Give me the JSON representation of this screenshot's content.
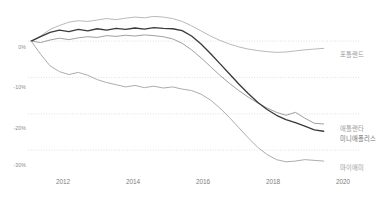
{
  "chart_data": {
    "type": "line",
    "title": "",
    "subtitle": "",
    "xlabel": "",
    "ylabel": "",
    "xlim": [
      2011.0,
      2020.6
    ],
    "ylim": [
      -36,
      8
    ],
    "grid": true,
    "grid_style": "dotted-horizontal",
    "legend_position": "right-inline-end-of-line",
    "xticks": [
      "2012",
      "2014",
      "2016",
      "2018",
      "2020"
    ],
    "xtick_values": [
      2012,
      2014,
      2016,
      2018,
      2020
    ],
    "yticks": [
      "0%",
      "-10%",
      "-20%",
      "-30%"
    ],
    "ytick_values": [
      0,
      -10,
      -20,
      -30
    ],
    "x": [
      2011.1,
      2011.4,
      2011.7,
      2012.0,
      2012.3,
      2012.6,
      2012.9,
      2013.2,
      2013.5,
      2013.8,
      2014.1,
      2014.4,
      2014.7,
      2015.0,
      2015.3,
      2015.6,
      2015.9,
      2016.2,
      2016.5,
      2016.8,
      2017.1,
      2017.4,
      2017.7,
      2018.0,
      2018.3,
      2018.6,
      2018.9,
      2019.2,
      2019.5,
      2019.8,
      2020.1,
      2020.4
    ],
    "series": [
      {
        "name": "포틀랜드",
        "color": "#b4b4b4",
        "label_x": 340,
        "label_y": 50,
        "values": [
          0,
          1.4,
          3.2,
          4.3,
          5.2,
          5.6,
          5.4,
          5.8,
          6.2,
          5.9,
          6.3,
          6.6,
          6.4,
          6.8,
          6.6,
          6.2,
          5.4,
          4.2,
          2.8,
          1.4,
          0.2,
          -0.8,
          -1.6,
          -2.2,
          -2.6,
          -2.9,
          -3.1,
          -3.0,
          -2.7,
          -2.4,
          -2.2,
          -2.0
        ]
      },
      {
        "name": "애틀랜타",
        "color": "#9a9a9a",
        "label_x": 340,
        "label_y": 124,
        "values": [
          0,
          -0.4,
          0.3,
          0.8,
          0.4,
          0.9,
          1.2,
          1.0,
          1.5,
          1.3,
          1.6,
          1.4,
          1.7,
          1.5,
          1.2,
          0.6,
          -0.6,
          -2.4,
          -4.6,
          -7.0,
          -9.4,
          -11.6,
          -13.6,
          -15.4,
          -17.0,
          -18.4,
          -19.6,
          -20.4,
          -19.6,
          -21.2,
          -22.6,
          -22.8
        ]
      },
      {
        "name": "미니애폴리스",
        "color": "#3a3a3a",
        "label_x": 340,
        "label_y": 134,
        "values": [
          0,
          1.2,
          2.4,
          3.0,
          2.6,
          3.2,
          2.8,
          3.4,
          3.0,
          3.5,
          3.2,
          3.6,
          3.3,
          3.7,
          3.5,
          3.4,
          2.9,
          1.4,
          -0.8,
          -3.4,
          -6.2,
          -9.0,
          -11.8,
          -14.4,
          -16.8,
          -18.8,
          -20.4,
          -21.6,
          -22.4,
          -23.4,
          -24.4,
          -24.8
        ]
      },
      {
        "name": "마이애미",
        "color": "#a8a8a8",
        "label_x": 340,
        "label_y": 163,
        "values": [
          0,
          -3.6,
          -6.8,
          -8.4,
          -9.2,
          -8.6,
          -9.4,
          -10.6,
          -11.4,
          -12.0,
          -12.6,
          -12.2,
          -12.8,
          -12.4,
          -12.9,
          -12.6,
          -13.2,
          -13.6,
          -14.6,
          -16.2,
          -18.4,
          -21.0,
          -23.8,
          -26.6,
          -29.2,
          -31.2,
          -32.6,
          -33.2,
          -33.0,
          -32.6,
          -32.8,
          -33.0
        ]
      }
    ]
  },
  "colors": {
    "gridline": "#d8d8d8",
    "axis_text": "#808080",
    "background": "#ffffff"
  }
}
